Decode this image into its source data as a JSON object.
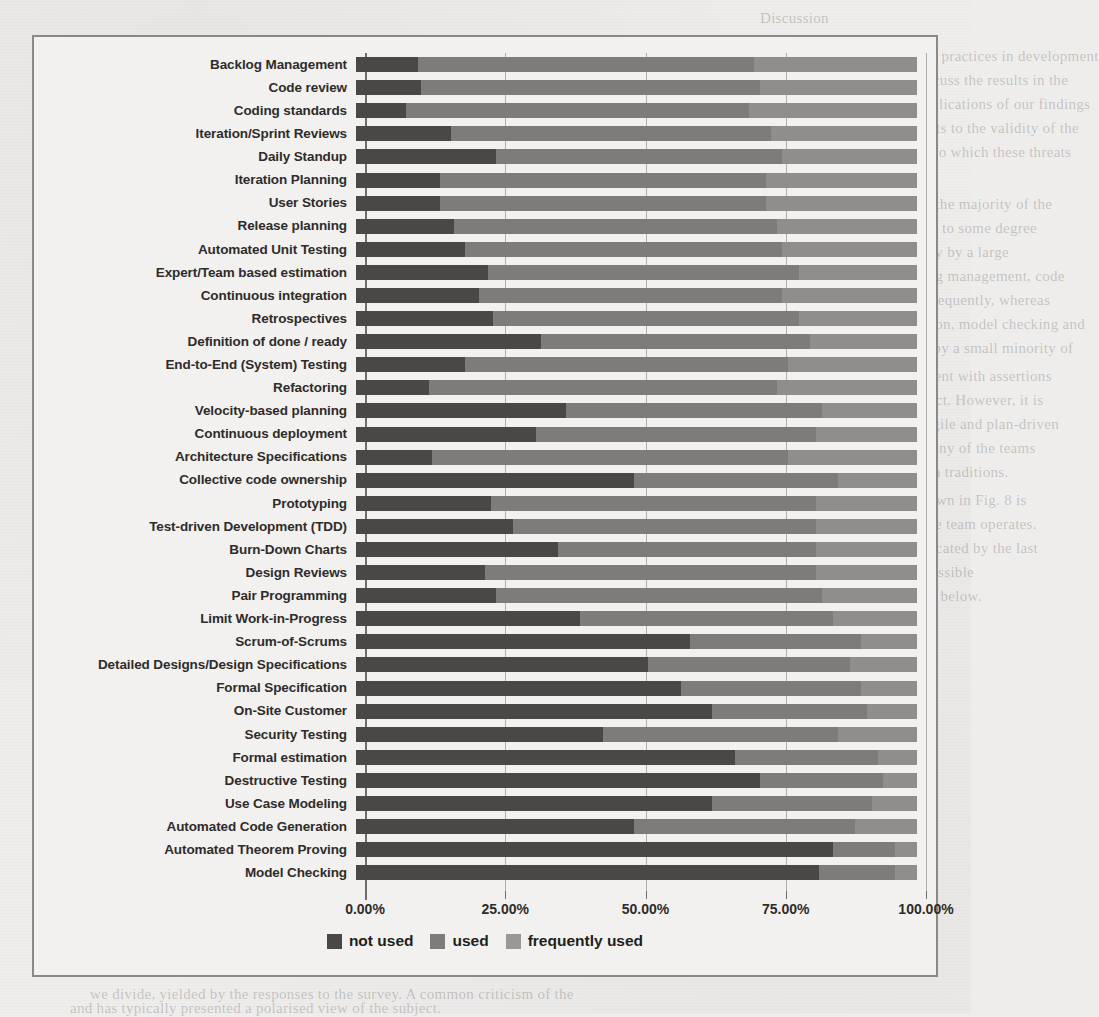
{
  "chart_data": {
    "type": "bar",
    "orientation": "horizontal",
    "stacked": true,
    "normalized": true,
    "title": "",
    "xlabel": "",
    "ylabel": "",
    "xlim": [
      0,
      100
    ],
    "xtick_labels": [
      "0.00%",
      "25.00%",
      "50.00%",
      "75.00%",
      "100.00%"
    ],
    "xticks": [
      0,
      25,
      50,
      75,
      100
    ],
    "grid": true,
    "legend_position": "bottom",
    "legend": [
      "not used",
      "used",
      "frequently used"
    ],
    "series": [
      {
        "name": "not used",
        "color": "#4a4846"
      },
      {
        "name": "used",
        "color": "#7e7c7a"
      },
      {
        "name": "frequently used",
        "color": "#908e8c"
      }
    ],
    "categories": [
      "Backlog Management",
      "Code review",
      "Coding standards",
      "Iteration/Sprint Reviews",
      "Daily Standup",
      "Iteration Planning",
      "User Stories",
      "Release planning",
      "Automated Unit Testing",
      "Expert/Team based estimation",
      "Continuous integration",
      "Retrospectives",
      "Definition of done / ready",
      "End-to-End (System) Testing",
      "Refactoring",
      "Velocity-based planning",
      "Continuous deployment",
      "Architecture Specifications",
      "Collective code ownership",
      "Prototyping",
      "Test-driven Development (TDD)",
      "Burn-Down Charts",
      "Design Reviews",
      "Pair Programming",
      "Limit Work-in-Progress",
      "Scrum-of-Scrums",
      "Detailed Designs/Design Specifications",
      "Formal Specification",
      "On-Site Customer",
      "Security Testing",
      "Formal estimation",
      "Destructive Testing",
      "Use Case Modeling",
      "Automated Code Generation",
      "Automated Theorem Proving",
      "Model Checking"
    ],
    "rows": [
      {
        "category": "Backlog Management",
        "not_used": 11.0,
        "used": 60.0,
        "frequently_used": 29.0
      },
      {
        "category": "Code review",
        "not_used": 11.5,
        "used": 60.5,
        "frequently_used": 28.0
      },
      {
        "category": "Coding standards",
        "not_used": 9.0,
        "used": 61.0,
        "frequently_used": 30.0
      },
      {
        "category": "Iteration/Sprint Reviews",
        "not_used": 17.0,
        "used": 57.0,
        "frequently_used": 26.0
      },
      {
        "category": "Daily Standup",
        "not_used": 25.0,
        "used": 51.0,
        "frequently_used": 24.0
      },
      {
        "category": "Iteration Planning",
        "not_used": 15.0,
        "used": 58.0,
        "frequently_used": 27.0
      },
      {
        "category": "User Stories",
        "not_used": 15.0,
        "used": 58.0,
        "frequently_used": 27.0
      },
      {
        "category": "Release planning",
        "not_used": 17.5,
        "used": 57.5,
        "frequently_used": 25.0
      },
      {
        "category": "Automated Unit Testing",
        "not_used": 19.5,
        "used": 56.5,
        "frequently_used": 24.0
      },
      {
        "category": "Expert/Team based estimation",
        "not_used": 23.5,
        "used": 55.5,
        "frequently_used": 21.0
      },
      {
        "category": "Continuous integration",
        "not_used": 22.0,
        "used": 54.0,
        "frequently_used": 24.0
      },
      {
        "category": "Retrospectives",
        "not_used": 24.5,
        "used": 54.5,
        "frequently_used": 21.0
      },
      {
        "category": "Definition of done / ready",
        "not_used": 33.0,
        "used": 48.0,
        "frequently_used": 19.0
      },
      {
        "category": "End-to-End (System) Testing",
        "not_used": 19.5,
        "used": 57.5,
        "frequently_used": 23.0
      },
      {
        "category": "Refactoring",
        "not_used": 13.0,
        "used": 62.0,
        "frequently_used": 25.0
      },
      {
        "category": "Velocity-based planning",
        "not_used": 37.5,
        "used": 45.5,
        "frequently_used": 17.0
      },
      {
        "category": "Continuous deployment",
        "not_used": 32.0,
        "used": 50.0,
        "frequently_used": 18.0
      },
      {
        "category": "Architecture Specifications",
        "not_used": 13.5,
        "used": 63.5,
        "frequently_used": 23.0
      },
      {
        "category": "Collective code ownership",
        "not_used": 49.5,
        "used": 36.5,
        "frequently_used": 14.0
      },
      {
        "category": "Prototyping",
        "not_used": 24.0,
        "used": 58.0,
        "frequently_used": 18.0
      },
      {
        "category": "Test-driven Development (TDD)",
        "not_used": 28.0,
        "used": 54.0,
        "frequently_used": 18.0
      },
      {
        "category": "Burn-Down Charts",
        "not_used": 36.0,
        "used": 46.0,
        "frequently_used": 18.0
      },
      {
        "category": "Design Reviews",
        "not_used": 23.0,
        "used": 59.0,
        "frequently_used": 18.0
      },
      {
        "category": "Pair Programming",
        "not_used": 25.0,
        "used": 58.0,
        "frequently_used": 17.0
      },
      {
        "category": "Limit Work-in-Progress",
        "not_used": 40.0,
        "used": 45.0,
        "frequently_used": 15.0
      },
      {
        "category": "Scrum-of-Scrums",
        "not_used": 59.5,
        "used": 30.5,
        "frequently_used": 10.0
      },
      {
        "category": "Detailed Designs/Design Specifications",
        "not_used": 52.0,
        "used": 36.0,
        "frequently_used": 12.0
      },
      {
        "category": "Formal Specification",
        "not_used": 58.0,
        "used": 32.0,
        "frequently_used": 10.0
      },
      {
        "category": "On-Site Customer",
        "not_used": 63.5,
        "used": 27.5,
        "frequently_used": 9.0
      },
      {
        "category": "Security Testing",
        "not_used": 44.0,
        "used": 42.0,
        "frequently_used": 14.0
      },
      {
        "category": "Formal estimation",
        "not_used": 67.5,
        "used": 25.5,
        "frequently_used": 7.0
      },
      {
        "category": "Destructive Testing",
        "not_used": 72.0,
        "used": 22.0,
        "frequently_used": 6.0
      },
      {
        "category": "Use Case Modeling",
        "not_used": 63.5,
        "used": 28.5,
        "frequently_used": 8.0
      },
      {
        "category": "Automated Code Generation",
        "not_used": 49.5,
        "used": 39.5,
        "frequently_used": 11.0
      },
      {
        "category": "Automated Theorem Proving",
        "not_used": 85.0,
        "used": 11.0,
        "frequently_used": 4.0
      },
      {
        "category": "Model Checking",
        "not_used": 82.5,
        "used": 13.5,
        "frequently_used": 4.0
      }
    ]
  },
  "background_text": {
    "lines": [
      "Discussion",
      "the results of our survey on the use of practices in development",
      "essing the research questions. We discuss the results in the",
      "the literature. We also discuss the implications of our findings",
      "practice. Finally, we present the threats to the validity of the",
      "reported in the survey and the extent to which these threats",
      "tigated.",
      "The results of our study indicate that the majority of the",
      "nisations have adopted agile practices to some degree",
      "practices are used at least occasionally by a large",
      "respondents. Practices such as backlog management, code",
      "and coding standards are used most frequently, whereas",
      "approaches such as formal specification, model checking and",
      "automated theorem proving are used by a small minority of",
      "teams. This pattern is broadly consistent with assertions",
      "made in earlier literature on the subject. However, it is",
      "to note that the distinction between agile and plan-driven",
      "is not always clear cut in practice. Many of the teams",
      "surveyed combine practices from both traditions.",
      "The relative ordering of practices shown in Fig. 8 is",
      "influenced by the domain in which the team operates.",
      "this effect is relatively modest as indicated by the last",
      "of the table. There are a number of possible",
      "for this observation which we discuss below.",
      "we divide, yielded by the responses to the survey. A common criticism of the",
      "and has typically presented a polarised view of the subject.",
      "consequence, we have attempted to look beyond this simplified picture."
    ]
  }
}
